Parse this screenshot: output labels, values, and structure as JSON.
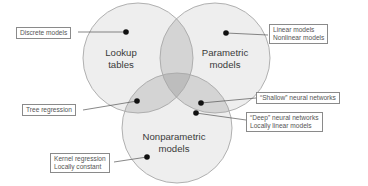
{
  "diagram": {
    "type": "venn",
    "sets": [
      {
        "id": "lookup",
        "title_line1": "Lookup",
        "title_line2": "tables"
      },
      {
        "id": "parametric",
        "title_line1": "Parametric",
        "title_line2": "models"
      },
      {
        "id": "nonparametric",
        "title_line1": "Nonparametric",
        "title_line2": "models"
      }
    ],
    "callouts": [
      {
        "id": "discrete",
        "region": "lookup only",
        "line1": "Discrete models"
      },
      {
        "id": "linear",
        "region": "parametric only",
        "line1": "Linear models",
        "line2": "Nonlinear models"
      },
      {
        "id": "tree",
        "region": "lookup ∩ nonparametric",
        "line1": "Tree regression"
      },
      {
        "id": "shallow",
        "region": "parametric ∩ nonparametric",
        "line1": "“Shallow” neural networks"
      },
      {
        "id": "deep",
        "region": "parametric ∩ nonparametric",
        "line1": "“Deep” neural networks",
        "line2": "Locally linear models"
      },
      {
        "id": "kernel",
        "region": "nonparametric only",
        "line1": "Kernel regression",
        "line2": "Locally constant"
      }
    ],
    "colors": {
      "circle_fill": "#eeeeee",
      "circle_stroke": "#a8a8a8",
      "pair_overlap": "#d4d4d4",
      "triple_overlap": "#bdbdbd",
      "dot": "#111111",
      "leader_line": "#555555",
      "label_border": "#8a8a8a"
    }
  }
}
